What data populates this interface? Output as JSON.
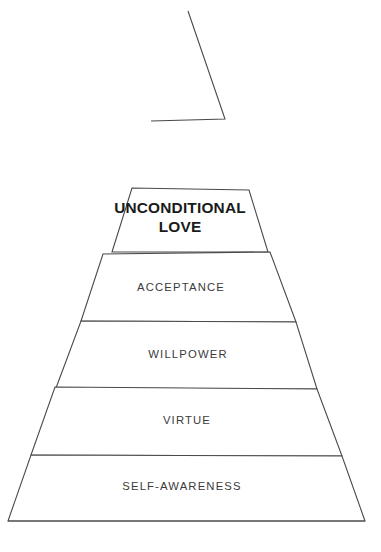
{
  "figure": {
    "kind": "ascending-pyramid-diagram",
    "title": "",
    "background_color": "#ffffff",
    "stroke_color": "#4a4a4a",
    "text_color": "#3b3b3b",
    "emphasis_text_color": "#1a1a1a",
    "levels": [
      {
        "id": "apex",
        "label": "",
        "emphasis": false,
        "outline_points": "188,11 225,119 151,121",
        "label_x": 0,
        "label_y": 0,
        "label_width": 0
      },
      {
        "id": "unconditional-love",
        "label": "UNCONDITIONAL\nLOVE",
        "emphasis": true,
        "outline_points": "132,188 249,190 268,252 112,252",
        "label_x": 96,
        "label_y": 199,
        "label_width": 168
      },
      {
        "id": "acceptance",
        "label": "ACCEPTANCE",
        "emphasis": false,
        "outline_points": "103,254 270,252 296,322 81,321",
        "label_x": 111,
        "label_y": 281,
        "label_width": 140
      },
      {
        "id": "willpower",
        "label": "WILLPOWER",
        "emphasis": false,
        "outline_points": "81,321 296,322 317,389 56,388",
        "label_x": 118,
        "label_y": 348,
        "label_width": 140
      },
      {
        "id": "virtue",
        "label": "VIRTUE",
        "emphasis": false,
        "outline_points": "55,387 317,389 342,456 31,455",
        "label_x": 117,
        "label_y": 414,
        "label_width": 140
      },
      {
        "id": "self-awareness",
        "label": "SELF-AWARENESS",
        "emphasis": false,
        "outline_points": "31,455 342,456 365,521 8,521",
        "label_x": 112,
        "label_y": 480,
        "label_width": 140
      }
    ],
    "baseline": {
      "id": "baseline",
      "points": "8,521 365,521"
    }
  }
}
